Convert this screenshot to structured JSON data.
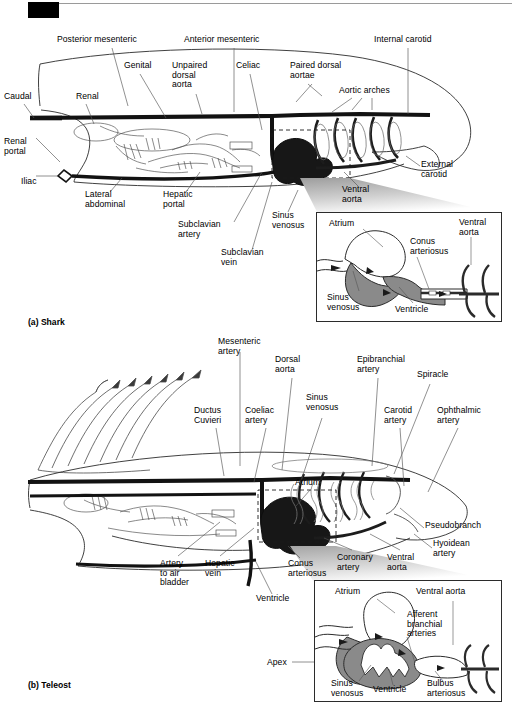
{
  "figure": {
    "panels": [
      {
        "id": "a",
        "caption": "(a) Shark"
      },
      {
        "id": "b",
        "caption": "(b) Teleost"
      }
    ]
  },
  "shark": {
    "caption": "(a) Shark",
    "labels": [
      {
        "name": "posterior-mesenteric",
        "text": "Posterior mesenteric",
        "x": 57,
        "y": 39
      },
      {
        "name": "anterior-mesenteric",
        "text": "Anterior mesenteric",
        "x": 184,
        "y": 39
      },
      {
        "name": "internal-carotid",
        "text": "Internal carotid",
        "x": 374,
        "y": 39
      },
      {
        "name": "genital",
        "text": "Genital",
        "x": 124,
        "y": 64
      },
      {
        "name": "unpaired-dorsal-aorta",
        "text": "Unpaired\ndorsal\naorta",
        "x": 172,
        "y": 64
      },
      {
        "name": "celiac",
        "text": "Celiac",
        "x": 236,
        "y": 64
      },
      {
        "name": "paired-dorsal-aortae",
        "text": "Paired dorsal\naortae",
        "x": 290,
        "y": 64
      },
      {
        "name": "aortic-arches",
        "text": "Aortic arches",
        "x": 339,
        "y": 89
      },
      {
        "name": "caudal",
        "text": "Caudal",
        "x": 4,
        "y": 95
      },
      {
        "name": "renal",
        "text": "Renal",
        "x": 76,
        "y": 95
      },
      {
        "name": "renal-portal",
        "text": "Renal\nportal",
        "x": 4,
        "y": 142
      },
      {
        "name": "iliac",
        "text": "Iliac",
        "x": 21,
        "y": 180
      },
      {
        "name": "lateral-abdominal",
        "text": "Lateral\nabdominal",
        "x": 85,
        "y": 194
      },
      {
        "name": "hepatic-portal",
        "text": "Hepatic\nportal",
        "x": 163,
        "y": 194
      },
      {
        "name": "subclavian-artery",
        "text": "Subclavian\nartery",
        "x": 178,
        "y": 224
      },
      {
        "name": "subclavian-vein",
        "text": "Subclavian\nvein",
        "x": 221,
        "y": 252
      },
      {
        "name": "sinus-venosus-body",
        "text": "Sinus\nvenosus",
        "x": 272,
        "y": 215
      },
      {
        "name": "external-carotid",
        "text": "External\ncarotid",
        "x": 421,
        "y": 163
      },
      {
        "name": "ventral-aorta-body",
        "text": "Ventral\naorta",
        "x": 342,
        "y": 188
      }
    ],
    "inset": {
      "name": "shark-heart-inset",
      "labels": [
        {
          "name": "atrium",
          "text": "Atrium",
          "x": 22,
          "y": 10
        },
        {
          "name": "conus-arteriosus",
          "text": "Conus\narteriosus",
          "x": 96,
          "y": 27
        },
        {
          "name": "ventral-aorta",
          "text": "Ventral\naorta",
          "x": 146,
          "y": 8
        },
        {
          "name": "sinus-venosus",
          "text": "Sinus\nvenosus",
          "x": 20,
          "y": 80
        },
        {
          "name": "ventricle",
          "text": "Ventricle",
          "x": 84,
          "y": 92
        }
      ]
    }
  },
  "teleost": {
    "caption": "(b) Teleost",
    "labels": [
      {
        "name": "mesenteric-artery",
        "text": "Mesenteric\nartery",
        "x": 218,
        "y": 340
      },
      {
        "name": "dorsal-aorta",
        "text": "Dorsal\naorta",
        "x": 275,
        "y": 358
      },
      {
        "name": "epibranchial-artery",
        "text": "Epibranchial\nartery",
        "x": 357,
        "y": 358
      },
      {
        "name": "spiracle",
        "text": "Spiracle",
        "x": 417,
        "y": 373
      },
      {
        "name": "ductus-cuvieri",
        "text": "Ductus\nCuvieri",
        "x": 194,
        "y": 409
      },
      {
        "name": "coeliac-artery",
        "text": "Coeliac\nartery",
        "x": 245,
        "y": 409
      },
      {
        "name": "sinus-venosus",
        "text": "Sinus\nvenosus",
        "x": 306,
        "y": 396
      },
      {
        "name": "carotid-artery",
        "text": "Carotid\nartery",
        "x": 384,
        "y": 409
      },
      {
        "name": "ophthalmic-artery",
        "text": "Ophthalmic\nartery",
        "x": 437,
        "y": 409
      },
      {
        "name": "atrium-body",
        "text": "Atrium",
        "x": 295,
        "y": 481
      },
      {
        "name": "pseudobranch",
        "text": "Pseudobranch",
        "x": 428,
        "y": 524
      },
      {
        "name": "hyoidean-artery",
        "text": "Hyoidean\nartery",
        "x": 436,
        "y": 542
      },
      {
        "name": "artery-to-air-bladder",
        "text": "Artery\nto air\nbladder",
        "x": 160,
        "y": 562
      },
      {
        "name": "hepatic-vein",
        "text": "Hepatic\nvein",
        "x": 205,
        "y": 562
      },
      {
        "name": "conus-arteriosus-body",
        "text": "Conus\narteriosus",
        "x": 288,
        "y": 562
      },
      {
        "name": "coronary-artery",
        "text": "Coronary\nartery",
        "x": 337,
        "y": 556
      },
      {
        "name": "ventral-aorta-body",
        "text": "Ventral\naorta",
        "x": 387,
        "y": 556
      },
      {
        "name": "ventricle-body",
        "text": "Ventricle",
        "x": 256,
        "y": 597
      },
      {
        "name": "apex",
        "text": "Apex",
        "x": 267,
        "y": 661
      }
    ],
    "inset": {
      "name": "teleost-heart-inset",
      "labels": [
        {
          "name": "atrium",
          "text": "Atrium",
          "x": 23,
          "y": 9
        },
        {
          "name": "ventral-aorta",
          "text": "Ventral aorta",
          "x": 105,
          "y": 9
        },
        {
          "name": "afferent-branchial-arteries",
          "text": "Afferent\nbranchial\narteries",
          "x": 95,
          "y": 32
        },
        {
          "name": "sinus-venosus",
          "text": "Sinus\nvenosus",
          "x": 20,
          "y": 93
        },
        {
          "name": "ventricle",
          "text": "Ventricle",
          "x": 62,
          "y": 101
        },
        {
          "name": "bulbus-arteriosus",
          "text": "Bulbus\narteriosus",
          "x": 114,
          "y": 93
        }
      ]
    }
  },
  "colors": {
    "ink": "#000000",
    "line": "#2b2b2b",
    "leader": "#555555",
    "vessel_dark": "#1a1a1a",
    "vessel_gray": "#8d8d8d",
    "heart_fill": "#7d7d7d",
    "wedge_top": "#b8b8b8",
    "wedge_bottom": "#ffffff",
    "page": "#ffffff"
  }
}
